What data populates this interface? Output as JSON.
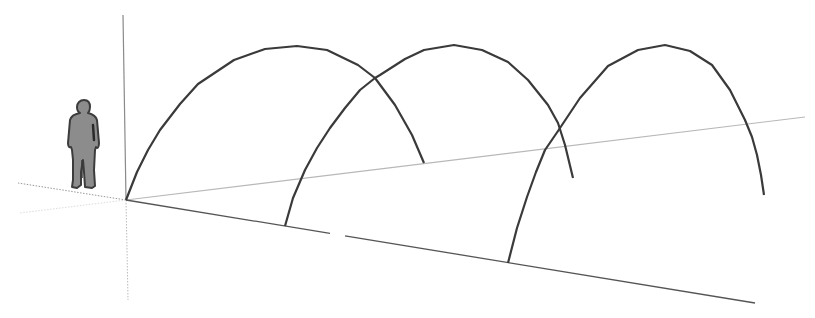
{
  "scene": {
    "description": "3D modeling viewport with three parabolic arches along the red axis and a scale human figure",
    "background": "#ffffff",
    "colors": {
      "arch_stroke": "#3a3a3a",
      "red_axis": "#555555",
      "green_axis": "#b8b8b8",
      "blue_axis": "#8a8a8a",
      "dotted_axis": "#9a9a9a",
      "figure_fill": "#8c8c8c",
      "figure_outline": "#3c3c3c"
    },
    "origin": [
      126,
      200
    ],
    "axes": {
      "blue_up": {
        "from": [
          126,
          200
        ],
        "to": [
          123,
          15
        ]
      },
      "green_positive": {
        "from": [
          126,
          200
        ],
        "to": [
          805,
          117
        ]
      },
      "red_positive": {
        "from": [
          126,
          200
        ],
        "to": [
          755,
          303
        ]
      },
      "red_negative_dotted": {
        "from": [
          126,
          200
        ],
        "to": [
          18,
          183
        ]
      },
      "green_negative_dotted": {
        "from": [
          126,
          200
        ],
        "to": [
          20,
          213
        ]
      },
      "blue_negative_dotted": {
        "from": [
          126,
          200
        ],
        "to": [
          128,
          300
        ]
      }
    },
    "arches": [
      {
        "name": "arch-1",
        "points": [
          [
            126,
            200
          ],
          [
            137,
            172
          ],
          [
            148,
            150
          ],
          [
            160,
            130
          ],
          [
            180,
            104
          ],
          [
            198,
            84
          ],
          [
            234,
            60
          ],
          [
            265,
            49
          ],
          [
            297,
            46
          ],
          [
            327,
            50
          ],
          [
            358,
            65
          ],
          [
            375,
            78
          ],
          [
            395,
            105
          ],
          [
            412,
            135
          ],
          [
            424,
            163
          ]
        ]
      },
      {
        "name": "arch-2",
        "points": [
          [
            285,
            226
          ],
          [
            293,
            198
          ],
          [
            305,
            170
          ],
          [
            317,
            148
          ],
          [
            330,
            128
          ],
          [
            345,
            108
          ],
          [
            360,
            90
          ],
          [
            375,
            78
          ],
          [
            380,
            75
          ],
          [
            405,
            59
          ],
          [
            424,
            50
          ],
          [
            454,
            45
          ],
          [
            482,
            50
          ],
          [
            508,
            62
          ],
          [
            528,
            80
          ],
          [
            548,
            105
          ],
          [
            558,
            123
          ],
          [
            565,
            145
          ],
          [
            573,
            178
          ]
        ]
      },
      {
        "name": "arch-3",
        "points": [
          [
            508,
            263
          ],
          [
            517,
            228
          ],
          [
            527,
            197
          ],
          [
            536,
            172
          ],
          [
            545,
            150
          ],
          [
            558,
            131
          ],
          [
            560,
            128
          ],
          [
            580,
            98
          ],
          [
            608,
            66
          ],
          [
            638,
            50
          ],
          [
            665,
            45
          ],
          [
            690,
            51
          ],
          [
            712,
            65
          ],
          [
            730,
            90
          ],
          [
            745,
            120
          ],
          [
            752,
            137
          ],
          [
            757,
            155
          ],
          [
            761,
            175
          ],
          [
            764,
            195
          ]
        ]
      }
    ],
    "baseline_gap": {
      "from_x": 330,
      "to_x": 345
    },
    "figure": {
      "name": "scale-figure",
      "x": 70,
      "y": 100,
      "width": 28,
      "height": 90
    }
  }
}
